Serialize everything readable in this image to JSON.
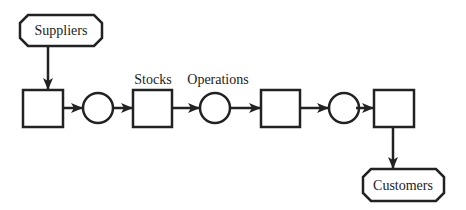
{
  "diagram": {
    "stroke_color": "#222222",
    "background": "#ffffff",
    "terminals": {
      "source": {
        "label": "Suppliers"
      },
      "sink": {
        "label": "Customers"
      }
    },
    "labels": {
      "stocks": "Stocks",
      "operations": "Operations"
    },
    "nodes": [
      {
        "id": "stock-1",
        "type": "stock"
      },
      {
        "id": "op-1",
        "type": "operation"
      },
      {
        "id": "stock-2",
        "type": "stock"
      },
      {
        "id": "op-2",
        "type": "operation"
      },
      {
        "id": "stock-3",
        "type": "stock"
      },
      {
        "id": "op-3",
        "type": "operation"
      },
      {
        "id": "stock-4",
        "type": "stock"
      }
    ],
    "edges": [
      [
        "Suppliers",
        "stock-1"
      ],
      [
        "stock-1",
        "op-1"
      ],
      [
        "op-1",
        "stock-2"
      ],
      [
        "stock-2",
        "op-2"
      ],
      [
        "op-2",
        "stock-3"
      ],
      [
        "stock-3",
        "op-3"
      ],
      [
        "op-3",
        "stock-4"
      ],
      [
        "stock-4",
        "Customers"
      ]
    ]
  }
}
